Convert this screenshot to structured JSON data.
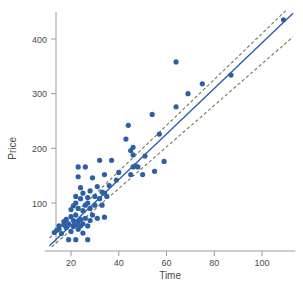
{
  "chart_data": {
    "type": "scatter",
    "title": "",
    "xlabel": "Time",
    "ylabel": "Price",
    "xlim": [
      9,
      114
    ],
    "ylim": [
      20,
      455
    ],
    "xticks": [
      20,
      40,
      60,
      80,
      100
    ],
    "yticks": [
      100,
      200,
      300,
      400
    ],
    "xticklabels": [
      "20",
      "40",
      "60",
      "80",
      "100"
    ],
    "yticklabels": [
      "100",
      "200",
      "300",
      "400"
    ],
    "grid": false,
    "legend": null,
    "point_color": "#2c5fa5",
    "fit_line_color": "#2c5fa5",
    "band_color": "#6e7a4e",
    "axis_color": "#9a9a9a",
    "series": [
      {
        "name": "observations",
        "marker": "circle",
        "points": [
          [
            13,
            46
          ],
          [
            14,
            50
          ],
          [
            15,
            52
          ],
          [
            15,
            58
          ],
          [
            16,
            44
          ],
          [
            17,
            60
          ],
          [
            17,
            66
          ],
          [
            18,
            55
          ],
          [
            18,
            70
          ],
          [
            19,
            33
          ],
          [
            19,
            62
          ],
          [
            20,
            48
          ],
          [
            20,
            75
          ],
          [
            20,
            88
          ],
          [
            21,
            57
          ],
          [
            21,
            68
          ],
          [
            21,
            95
          ],
          [
            22,
            33
          ],
          [
            22,
            60
          ],
          [
            22,
            78
          ],
          [
            22,
            100
          ],
          [
            22,
            112
          ],
          [
            23,
            52
          ],
          [
            23,
            66
          ],
          [
            23,
            90
          ],
          [
            23,
            148
          ],
          [
            23,
            166
          ],
          [
            24,
            58
          ],
          [
            24,
            70
          ],
          [
            24,
            108
          ],
          [
            24,
            128
          ],
          [
            25,
            45
          ],
          [
            25,
            62
          ],
          [
            25,
            86
          ],
          [
            25,
            118
          ],
          [
            26,
            72
          ],
          [
            26,
            96
          ],
          [
            26,
            166
          ],
          [
            27,
            33
          ],
          [
            27,
            58
          ],
          [
            27,
            100
          ],
          [
            27,
            110
          ],
          [
            28,
            68
          ],
          [
            28,
            90
          ],
          [
            28,
            122
          ],
          [
            29,
            78
          ],
          [
            29,
            146
          ],
          [
            30,
            96
          ],
          [
            30,
            112
          ],
          [
            31,
            72
          ],
          [
            31,
            130
          ],
          [
            32,
            108
          ],
          [
            32,
            178
          ],
          [
            33,
            96
          ],
          [
            33,
            120
          ],
          [
            34,
            74
          ],
          [
            34,
            118
          ],
          [
            34,
            152
          ],
          [
            35,
            112
          ],
          [
            36,
            132
          ],
          [
            37,
            178
          ],
          [
            39,
            142
          ],
          [
            40,
            156
          ],
          [
            43,
            217
          ],
          [
            44,
            242
          ],
          [
            45,
            152
          ],
          [
            45,
            196
          ],
          [
            46,
            166
          ],
          [
            46,
            188
          ],
          [
            46,
            202
          ],
          [
            47,
            168
          ],
          [
            48,
            166
          ],
          [
            50,
            152
          ],
          [
            51,
            186
          ],
          [
            54,
            262
          ],
          [
            55,
            158
          ],
          [
            57,
            226
          ],
          [
            59,
            176
          ],
          [
            64,
            358
          ],
          [
            64,
            276
          ],
          [
            69,
            300
          ],
          [
            75,
            318
          ],
          [
            87,
            334
          ],
          [
            109,
            435
          ]
        ]
      }
    ],
    "fit_line": {
      "name": "least-squares-fit",
      "style": "solid",
      "x1": 11,
      "y1": 22,
      "x2": 113,
      "y2": 447
    },
    "bands": [
      {
        "name": "upper-band",
        "style": "dashed",
        "x1": 11,
        "y1": 36,
        "x2": 110,
        "y2": 452
      },
      {
        "name": "lower-band",
        "style": "dashed",
        "x1": 12,
        "y1": 20,
        "x2": 113,
        "y2": 404
      }
    ]
  }
}
